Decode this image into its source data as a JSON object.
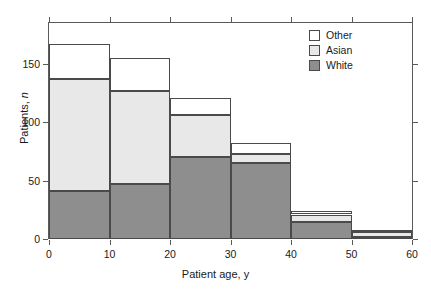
{
  "chart_data": {
    "type": "bar",
    "subtype": "stacked-histogram",
    "title": "",
    "xlabel": "Patient age, y",
    "ylabel": "Patients, n",
    "ylabel_parts": {
      "main": "Patients, ",
      "italic": "n"
    },
    "categories": [
      "0-10",
      "10-20",
      "20-30",
      "30-40",
      "40-50",
      "50-60"
    ],
    "bin_edges": [
      0,
      10,
      20,
      30,
      40,
      50,
      60
    ],
    "series": [
      {
        "name": "White",
        "color": "#8e8e8e",
        "values": [
          41,
          47,
          70,
          65,
          15,
          2
        ]
      },
      {
        "name": "Asian",
        "color": "#e8e8e8",
        "values": [
          96,
          80,
          36,
          8,
          6,
          4
        ]
      },
      {
        "name": "Other",
        "color": "#ffffff",
        "values": [
          30,
          28,
          15,
          9,
          3,
          2
        ]
      }
    ],
    "stack_order": [
      "White",
      "Asian",
      "Other"
    ],
    "totals": [
      167,
      155,
      121,
      82,
      24,
      8
    ],
    "xlim": [
      0,
      60
    ],
    "ylim": [
      0,
      185
    ],
    "xticks": [
      "0",
      "10",
      "20",
      "30",
      "40",
      "50",
      "60"
    ],
    "xtick_values": [
      0,
      10,
      20,
      30,
      40,
      50,
      60
    ],
    "yticks": [
      "0",
      "50",
      "100",
      "150"
    ],
    "ytick_values": [
      0,
      50,
      100,
      150
    ],
    "grid": false,
    "legend_position": "top-right",
    "legend_entries": [
      {
        "label": "Other",
        "color": "#ffffff"
      },
      {
        "label": "Asian",
        "color": "#e8e8e8"
      },
      {
        "label": "White",
        "color": "#8e8e8e"
      }
    ],
    "frame_color": "#5a5a5a",
    "bar_border_color": "#4a4a4a"
  }
}
